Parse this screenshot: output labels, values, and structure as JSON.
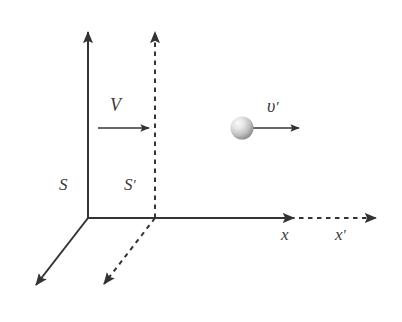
{
  "figure": {
    "type": "physics-reference-frames-diagram",
    "background_color": "#ffffff",
    "stroke_color": "#333333",
    "label_color": "#3a3a3a"
  },
  "labels": {
    "frame_S": "S",
    "frame_S_prime_base": "S",
    "frame_S_prime_mark": "′",
    "velocity_V": "V",
    "velocity_v_prime_base": "υ",
    "velocity_v_prime_mark": "′",
    "axis_x": "x",
    "axis_x_prime_base": "x",
    "axis_x_prime_mark": "′"
  },
  "elements": {
    "frame_S": {
      "name": "S",
      "line_style": "solid",
      "origin": [
        88,
        218
      ],
      "y_axis_tip": [
        88,
        26
      ],
      "x_axis_tip": [
        300,
        218
      ],
      "z_axis_tip": [
        30,
        292
      ]
    },
    "frame_S_prime": {
      "name": "S'",
      "line_style": "dashed",
      "origin": [
        155,
        218
      ],
      "y_axis_tip": [
        155,
        26
      ],
      "x_axis_tip": [
        382,
        218
      ],
      "z_axis_tip": [
        98,
        291
      ]
    },
    "velocity_V_arrow": {
      "label": "V",
      "line_style": "solid",
      "start": [
        98,
        128
      ],
      "end": [
        155,
        128
      ]
    },
    "particle": {
      "shape": "sphere",
      "center": [
        242,
        128
      ],
      "radius": 11,
      "fill_light": "#f2f2f2",
      "fill_dark": "#8e8e8e"
    },
    "velocity_v_prime_arrow": {
      "label": "υ′",
      "line_style": "solid",
      "start": [
        253,
        128
      ],
      "end": [
        305,
        128
      ]
    }
  }
}
